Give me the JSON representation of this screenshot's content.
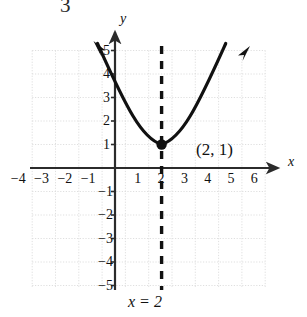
{
  "figure": {
    "problem_number": "3",
    "x_axis_label": "x",
    "y_axis_label": "y",
    "vertex_label": "(2, 1)",
    "line_equation_label": "x = 2",
    "colors": {
      "curve": "#111111",
      "axis": "#2b2b2b",
      "grid": "#d3d3d3",
      "dashed_line": "#111111",
      "point": "#111111",
      "text": "#111111"
    }
  },
  "chart_data": {
    "type": "line",
    "title": "",
    "subtitle": "",
    "xlabel": "x",
    "ylabel": "y",
    "xlim": [
      -4.6,
      6.6
    ],
    "ylim": [
      -5.1,
      5.4
    ],
    "grid": true,
    "grid_step": 1,
    "legend": "none",
    "x_ticks": [
      -4,
      -3,
      -2,
      -1,
      1,
      2,
      3,
      4,
      5,
      6
    ],
    "x_tick_labels": [
      "-4",
      "-3",
      "-2",
      "-1",
      "1",
      "2",
      "3",
      "4",
      "5",
      "6"
    ],
    "y_ticks": [
      5,
      4,
      3,
      2,
      1,
      -1,
      -2,
      -3,
      -4,
      -5
    ],
    "y_tick_labels": [
      "5",
      "4",
      "3",
      "2",
      "1",
      "-1",
      "-2",
      "-3",
      "-4",
      "-5"
    ],
    "series": [
      {
        "name": "parabola",
        "equation": "y = (x - 2)^2 / 2.6 + 1",
        "style": "solid-thick-with-arrowheads",
        "x": [
          -1.25,
          -1.0,
          -0.5,
          0.0,
          0.5,
          1.0,
          1.5,
          2.0,
          2.5,
          3.0,
          3.5,
          4.0,
          4.5,
          5.0,
          5.35
        ],
        "y": [
          5.3,
          4.46,
          3.4,
          2.54,
          1.87,
          1.38,
          1.1,
          1.0,
          1.1,
          1.38,
          1.87,
          2.54,
          3.4,
          4.46,
          5.3
        ]
      },
      {
        "name": "axis-of-symmetry",
        "equation": "x = 2",
        "style": "dashed-vertical",
        "x": [
          2,
          2
        ],
        "y": [
          -5,
          5.2
        ]
      }
    ],
    "points": [
      {
        "name": "vertex",
        "x": 2,
        "y": 1,
        "label": "(2, 1)",
        "marker": "filled-circle"
      }
    ],
    "annotations": [
      {
        "name": "problem-number",
        "text": "3"
      },
      {
        "name": "axis-of-symmetry-equation",
        "text": "x = 2"
      }
    ]
  }
}
